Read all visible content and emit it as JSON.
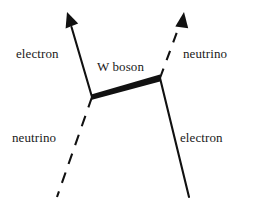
{
  "diagram": {
    "kind": "feynman-diagram",
    "background_color": "#ffffff",
    "line_color": "#111111",
    "canvas": {
      "width": 253,
      "height": 204
    },
    "labels": {
      "electron_incoming": "electron",
      "neutrino_outgoing": "neutrino",
      "w_boson": "W boson",
      "neutrino_incoming": "neutrino",
      "electron_outgoing": "electron"
    },
    "vertices": [
      {
        "name": "left-vertex",
        "x": 92,
        "y": 97
      },
      {
        "name": "right-vertex",
        "x": 160,
        "y": 78
      }
    ],
    "lines": [
      {
        "name": "electron-upper-left-line",
        "particle": "electron",
        "style": "solid",
        "arrow": "end",
        "from": {
          "x": 92,
          "y": 97
        },
        "to": {
          "x": 68,
          "y": 16
        }
      },
      {
        "name": "neutrino-lower-left-line",
        "particle": "neutrino",
        "style": "dashed",
        "arrow": "none",
        "from": {
          "x": 92,
          "y": 97
        },
        "to": {
          "x": 57,
          "y": 197
        }
      },
      {
        "name": "w-boson-propagator",
        "particle": "W boson",
        "style": "thick-solid",
        "arrow": "none",
        "from": {
          "x": 92,
          "y": 97
        },
        "to": {
          "x": 160,
          "y": 78
        }
      },
      {
        "name": "neutrino-upper-right-line",
        "particle": "neutrino",
        "style": "dashed",
        "arrow": "end",
        "from": {
          "x": 160,
          "y": 78
        },
        "to": {
          "x": 183,
          "y": 16
        }
      },
      {
        "name": "electron-lower-right-line",
        "particle": "electron",
        "style": "solid",
        "arrow": "none",
        "from": {
          "x": 160,
          "y": 78
        },
        "to": {
          "x": 189,
          "y": 197
        }
      }
    ]
  }
}
